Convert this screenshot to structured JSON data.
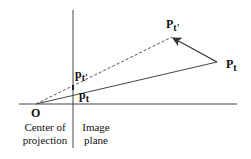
{
  "diagram": {
    "labels": {
      "origin": "O",
      "center_line1": "Center of",
      "center_line2": "projection",
      "image_line1": "Image",
      "image_line2": "plane",
      "p_main": "P",
      "p_main_sub": "t",
      "p_prime": "P",
      "p_prime_sub": "t'",
      "p_img": "p",
      "p_img_sub": "t",
      "p_img_prime": "p",
      "p_img_prime_sub": "t'"
    },
    "colors": {
      "line": "#333333",
      "text": "#111111",
      "background": "#ffffff"
    }
  }
}
